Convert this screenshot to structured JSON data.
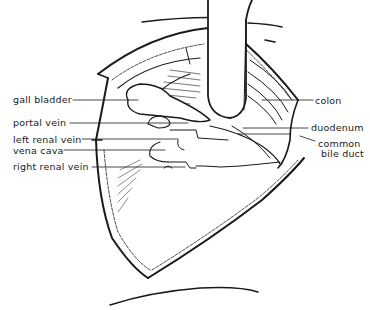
{
  "figure": {
    "type": "anatomical line drawing",
    "labels_left": [
      {
        "id": "gall_bladder",
        "text": "gall bladder"
      },
      {
        "id": "portal_vein",
        "text": "portal vein"
      },
      {
        "id": "left_renal_vein",
        "text": "left renal vein"
      },
      {
        "id": "vena_cava",
        "text": "vena cava"
      },
      {
        "id": "right_renal_vein",
        "text": "right renal vein"
      }
    ],
    "labels_right": [
      {
        "id": "colon",
        "text": "colon"
      },
      {
        "id": "duodenum",
        "text": "duodenum"
      },
      {
        "id": "common_bile_duct_1",
        "text": "common"
      },
      {
        "id": "common_bile_duct_2",
        "text": "bile duct"
      }
    ],
    "colors": {
      "ink": "#1a1a1a",
      "background": "#ffffff"
    }
  }
}
